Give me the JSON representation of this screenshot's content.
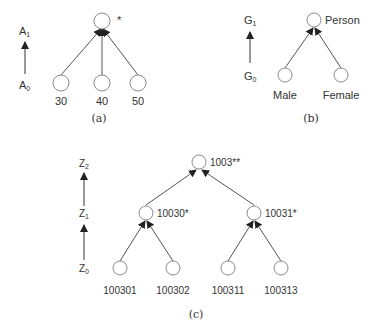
{
  "panels": {
    "a": {
      "caption": "(a)",
      "levels": {
        "top": "A",
        "top_sub": "1",
        "bottom": "A",
        "bottom_sub": "0"
      },
      "root": {
        "label": "*"
      },
      "leaves": [
        {
          "label": "30"
        },
        {
          "label": "40"
        },
        {
          "label": "50"
        }
      ]
    },
    "b": {
      "caption": "(b)",
      "levels": {
        "top": "G",
        "top_sub": "1",
        "bottom": "G",
        "bottom_sub": "0"
      },
      "root": {
        "label": "Person"
      },
      "leaves": [
        {
          "label": "Male"
        },
        {
          "label": "Female"
        }
      ]
    },
    "c": {
      "caption": "(c)",
      "levels": {
        "l2": "Z",
        "l2_sub": "2",
        "l1": "Z",
        "l1_sub": "1",
        "l0": "Z",
        "l0_sub": "0"
      },
      "root": {
        "label": "1003**"
      },
      "middle": [
        {
          "label": "10030*"
        },
        {
          "label": "10031*"
        }
      ],
      "leaves": [
        {
          "label": "100301"
        },
        {
          "label": "100302"
        },
        {
          "label": "100311"
        },
        {
          "label": "100313"
        }
      ]
    }
  }
}
